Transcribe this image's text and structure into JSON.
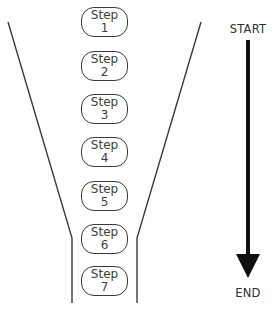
{
  "diagram": {
    "type": "funnel-process",
    "steps": [
      {
        "label": "Step",
        "number": "1"
      },
      {
        "label": "Step",
        "number": "2"
      },
      {
        "label": "Step",
        "number": "3"
      },
      {
        "label": "Step",
        "number": "4"
      },
      {
        "label": "Step",
        "number": "5"
      },
      {
        "label": "Step",
        "number": "6"
      },
      {
        "label": "Step",
        "number": "7"
      }
    ],
    "arrow": {
      "start_label": "START",
      "end_label": "END",
      "direction": "down",
      "color": "#111111"
    },
    "colors": {
      "stroke": "#3a3a3a",
      "background": "#ffffff"
    }
  }
}
